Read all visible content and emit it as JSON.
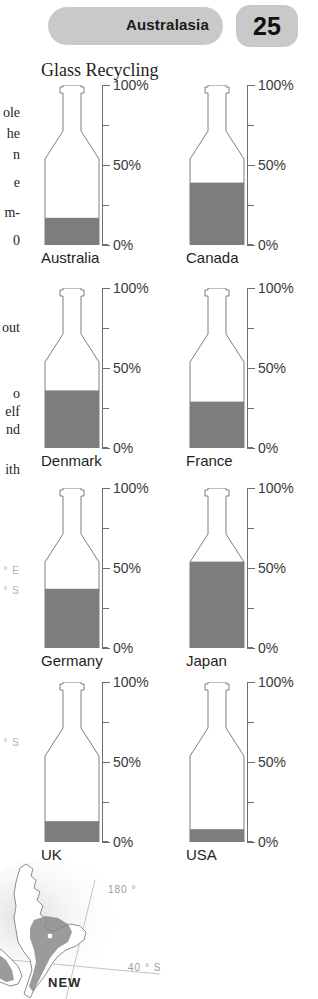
{
  "header": {
    "region_label": "Australasia",
    "page_number": "25",
    "pill_color": "#c9c9c9"
  },
  "chart": {
    "title": "Glass Recycling",
    "fill_color": "#7d7d7d",
    "outline_color": "#7e7e7e",
    "axis_color": "#6e6e6e"
  },
  "chart_data": {
    "type": "bar",
    "title": "Glass Recycling",
    "xlabel": "",
    "ylabel": "",
    "ylim": [
      0,
      100
    ],
    "unit": "%",
    "tick_labels": [
      "0%",
      "50%",
      "100%"
    ],
    "tick_values": [
      0,
      25,
      50,
      75,
      100
    ],
    "grid": false,
    "legend": "none",
    "layout": "2 columns x 4 rows of bottle-shaped gauges",
    "categories": [
      "Australia",
      "Canada",
      "Denmark",
      "France",
      "Germany",
      "Japan",
      "UK",
      "USA"
    ],
    "values": [
      17,
      39,
      36,
      29,
      37,
      54,
      13,
      8
    ]
  },
  "panels": [
    {
      "country": "Australia",
      "value": 17
    },
    {
      "country": "Canada",
      "value": 39
    },
    {
      "country": "Denmark",
      "value": 36
    },
    {
      "country": "France",
      "value": 29
    },
    {
      "country": "Germany",
      "value": 37
    },
    {
      "country": "Japan",
      "value": 54
    },
    {
      "country": "UK",
      "value": 13
    },
    {
      "country": "USA",
      "value": 8
    }
  ],
  "axis_labels": {
    "top": "100%",
    "mid": "50%",
    "bottom": "0%"
  },
  "gutter_text": {
    "lines": [
      "ole",
      "he",
      "n",
      "e",
      "m-",
      "0",
      "out",
      "o",
      "elf",
      "nd",
      "ith"
    ]
  },
  "map": {
    "country_name": "NEW",
    "grid_labels": [
      "180 °",
      "40 ° S"
    ],
    "gutter_grid_labels": [
      "0 ° E",
      "-20 ° S",
      "0 ° S"
    ]
  }
}
